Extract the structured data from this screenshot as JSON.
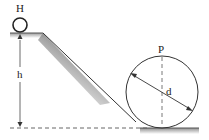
{
  "diagram": {
    "ball_label": "H",
    "height_label": "h",
    "loop_label": "P",
    "diameter_label": "d",
    "colors": {
      "stroke": "#333333",
      "shade_dark": "#9a9a9a",
      "background": "#ffffff"
    }
  }
}
